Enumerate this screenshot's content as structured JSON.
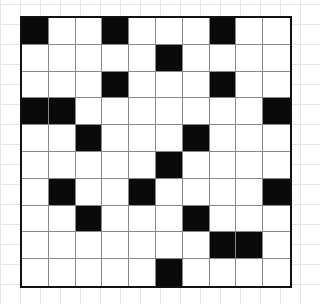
{
  "puzzle": {
    "type": "crossword-grid",
    "rows": 10,
    "cols": 10,
    "colors": {
      "black": "#0a0a0a",
      "white": "#ffffff",
      "border": "#111111",
      "grid_line": "#888888",
      "paper_line": "#e6e6e6"
    },
    "black_cells": [
      [
        0,
        0
      ],
      [
        0,
        3
      ],
      [
        0,
        7
      ],
      [
        1,
        5
      ],
      [
        2,
        3
      ],
      [
        2,
        7
      ],
      [
        3,
        0
      ],
      [
        3,
        1
      ],
      [
        3,
        9
      ],
      [
        4,
        2
      ],
      [
        4,
        6
      ],
      [
        5,
        5
      ],
      [
        6,
        1
      ],
      [
        6,
        4
      ],
      [
        6,
        9
      ],
      [
        7,
        2
      ],
      [
        7,
        6
      ],
      [
        8,
        7
      ],
      [
        8,
        8
      ],
      [
        9,
        5
      ]
    ]
  }
}
